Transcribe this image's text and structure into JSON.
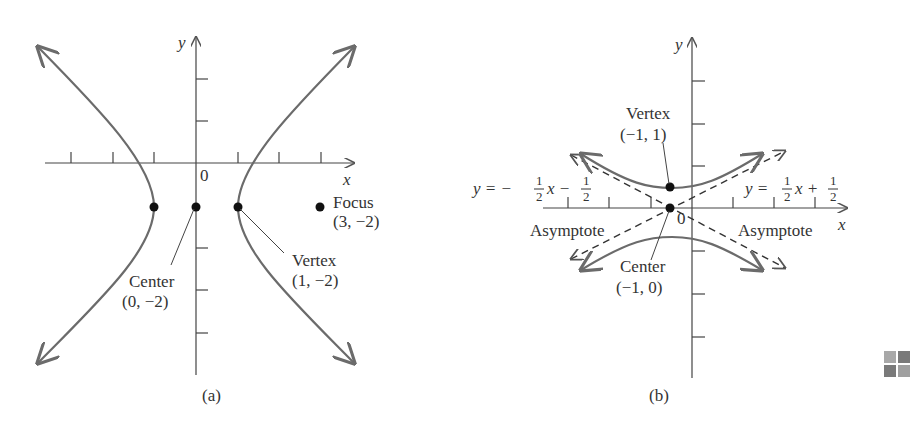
{
  "panel_a": {
    "caption": "(a)",
    "x_axis_label": "x",
    "y_axis_label": "y",
    "origin_label": "0",
    "focus": {
      "label": "Focus",
      "coords": "(3, −2)"
    },
    "center": {
      "label": "Center",
      "coords": "(0, −2)"
    },
    "vertex": {
      "label": "Vertex",
      "coords": "(1, −2)"
    }
  },
  "panel_b": {
    "caption": "(b)",
    "x_axis_label": "x",
    "y_axis_label": "y",
    "origin_label": "0",
    "vertex": {
      "label": "Vertex",
      "coords": "(−1, 1)"
    },
    "center": {
      "label": "Center",
      "coords": "(−1, 0)"
    },
    "asymptote_left": {
      "label": "Asymptote",
      "eq_prefix": "y = −",
      "eq_mid": "x −",
      "frac_num": "1",
      "frac_den": "2"
    },
    "asymptote_right": {
      "label": "Asymptote",
      "eq_prefix": "y =",
      "eq_mid": "x +",
      "frac_num": "1",
      "frac_den": "2"
    }
  },
  "colors": {
    "curve": "#6b6b6b",
    "axis": "#444444",
    "text": "#333333",
    "point": "#111111"
  },
  "icon": "grid-icon"
}
